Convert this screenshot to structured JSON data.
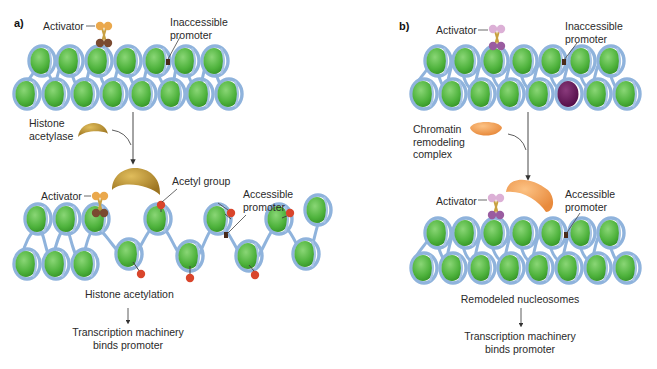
{
  "panels": {
    "a": {
      "letter": "a)",
      "top": {
        "activator_label": "Activator",
        "inaccessible_promoter_label": [
          "Inaccessible",
          "promoter"
        ]
      },
      "enzyme_label": [
        "Histone",
        "acetylase"
      ],
      "bottom": {
        "activator_label": "Activator",
        "acetyl_group_label": "Acetyl group",
        "accessible_promoter_label": [
          "Accessible",
          "promoter"
        ],
        "acetyl_tag_text": "Ac"
      },
      "process_label": "Histone acetylation",
      "result_label": [
        "Transcription machinery",
        "binds promoter"
      ]
    },
    "b": {
      "letter": "b)",
      "top": {
        "activator_label": "Activator",
        "inaccessible_promoter_label": [
          "Inaccessible",
          "promoter"
        ]
      },
      "enzyme_label": [
        "Chromatin",
        "remodeling",
        "complex"
      ],
      "bottom": {
        "activator_label": "Activator",
        "accessible_promoter_label": [
          "Accessible",
          "promoter"
        ]
      },
      "process_label": "Remodeled nucleosomes",
      "result_label": [
        "Transcription machinery",
        "binds promoter"
      ]
    }
  },
  "colors": {
    "histone_core": "#5cbf4a",
    "dna_wrap": "#8fb3dc",
    "acetylase": "#b8912e",
    "remodeler": "#f0a25a",
    "acetyl_tag": "#d9452b",
    "activator_a_top": "#e7a64a",
    "activator_a_bottom": "#7a4a30",
    "activator_b_top": "#d9a8d4",
    "activator_b_bottom": "#9a5ca0",
    "remodeled_histone": "#6a1b5c",
    "promoter_mark": "#4a2a1a"
  }
}
